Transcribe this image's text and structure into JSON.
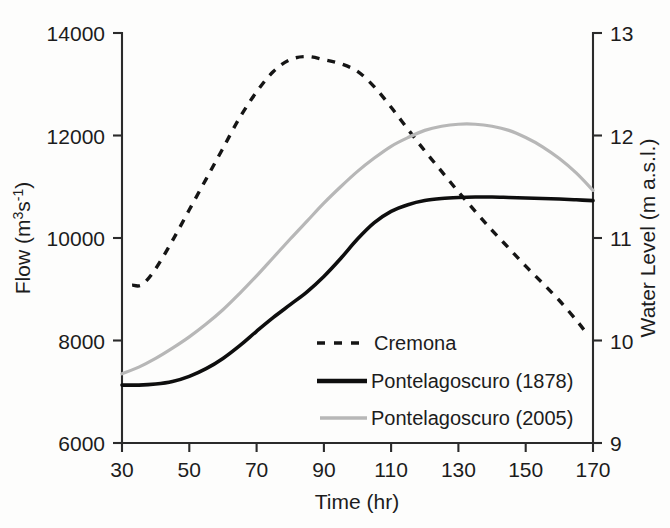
{
  "chart_data": {
    "type": "line",
    "title": "",
    "xlabel": "Time (hr)",
    "ylabel": "Flow (m3s-1)",
    "ylabel_left": "Flow (m",
    "ylabel_left_sup1": "3",
    "ylabel_left_mid": "s",
    "ylabel_left_sup2": "-1",
    "ylabel_left_end": ")",
    "y2label": "Water Level (m a.s.l.)",
    "xlim": [
      30,
      170
    ],
    "ylim": [
      6000,
      14000
    ],
    "y2lim": [
      9,
      13
    ],
    "xticks": [
      30,
      50,
      70,
      90,
      110,
      130,
      150,
      170
    ],
    "xticklabels": [
      "30",
      "50",
      "70",
      "90",
      "110",
      "130",
      "150",
      "170"
    ],
    "yticks": [
      6000,
      8000,
      10000,
      12000,
      14000
    ],
    "yticklabels": [
      "6000",
      "8000",
      "10000",
      "12000",
      "14000"
    ],
    "y2ticks": [
      9,
      10,
      11,
      12,
      13
    ],
    "y2ticklabels": [
      "9",
      "10",
      "11",
      "12",
      "13"
    ],
    "grid": false,
    "legend_position": "center-right-inside",
    "series": [
      {
        "name": "Cremona",
        "style": "dashed",
        "color": "#151515",
        "axis": "left",
        "x": [
          33,
          36,
          40,
          45,
          50,
          55,
          60,
          65,
          70,
          75,
          80,
          85,
          90,
          95,
          100,
          105,
          110,
          115,
          120,
          125,
          130,
          135,
          140,
          145,
          150,
          155,
          160,
          165,
          168
        ],
        "values": [
          9080,
          9090,
          9400,
          9950,
          10550,
          11150,
          11750,
          12350,
          12850,
          13250,
          13480,
          13540,
          13480,
          13400,
          13250,
          12950,
          12550,
          12120,
          11700,
          11300,
          10900,
          10520,
          10150,
          9800,
          9450,
          9120,
          8780,
          8400,
          8150
        ]
      },
      {
        "name": "Pontelagoscuro (1878)",
        "style": "solid",
        "color": "#0e0e0e",
        "axis": "left",
        "x": [
          30,
          35,
          40,
          45,
          50,
          55,
          60,
          65,
          70,
          75,
          80,
          85,
          90,
          95,
          100,
          105,
          110,
          115,
          120,
          125,
          130,
          135,
          140,
          145,
          150,
          155,
          160,
          165,
          170
        ],
        "values": [
          7130,
          7130,
          7150,
          7200,
          7300,
          7450,
          7650,
          7900,
          8180,
          8450,
          8700,
          8950,
          9250,
          9600,
          9980,
          10300,
          10520,
          10650,
          10730,
          10770,
          10790,
          10800,
          10800,
          10790,
          10780,
          10770,
          10760,
          10745,
          10730
        ]
      },
      {
        "name": "Pontelagoscuro (2005)",
        "style": "solid",
        "color": "#b7b7b7",
        "axis": "left",
        "x": [
          30,
          35,
          40,
          45,
          50,
          55,
          60,
          65,
          70,
          75,
          80,
          85,
          90,
          95,
          100,
          105,
          110,
          115,
          120,
          125,
          130,
          135,
          140,
          145,
          150,
          155,
          160,
          165,
          170
        ],
        "values": [
          7350,
          7480,
          7650,
          7850,
          8070,
          8320,
          8600,
          8920,
          9260,
          9620,
          9980,
          10330,
          10680,
          11000,
          11300,
          11560,
          11790,
          11960,
          12100,
          12180,
          12220,
          12220,
          12180,
          12100,
          11960,
          11780,
          11550,
          11270,
          10930
        ]
      }
    ],
    "legend_entries": [
      {
        "label": "Cremona",
        "style": "dashed",
        "color": "#151515"
      },
      {
        "label": "Pontelagoscuro (1878)",
        "style": "solid",
        "color": "#0e0e0e"
      },
      {
        "label": "Pontelagoscuro (2005)",
        "style": "solid",
        "color": "#b7b7b7"
      }
    ]
  }
}
